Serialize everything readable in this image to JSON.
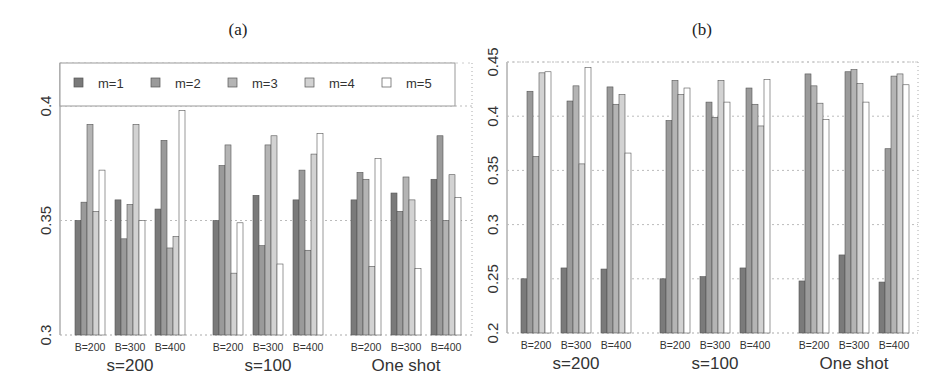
{
  "colors": {
    "m1": "#7a7a7a",
    "m2": "#9a9a9a",
    "m3": "#b4b4b4",
    "m4": "#d2d2d2",
    "m5": "#ffffff",
    "stroke": "#555555",
    "grid": "#bbbbbb"
  },
  "chart_data": [
    {
      "type": "bar",
      "title": "(a)",
      "xlabel": "",
      "ylabel": "",
      "ylim": [
        0.3,
        0.4
      ],
      "yticks": [
        0.3,
        0.35,
        0.4
      ],
      "ytick_labels": [
        "0.3",
        "0.35",
        "0.4"
      ],
      "grid": "horizontal dotted",
      "legend": [
        "m=1",
        "m=2",
        "m=3",
        "m=4",
        "m=5"
      ],
      "legend_position": "top inside",
      "groups": [
        "s=200",
        "s=100",
        "One shot"
      ],
      "subcategories": [
        "B=200",
        "B=300",
        "B=400"
      ],
      "series": [
        {
          "name": "m=1",
          "values": [
            [
              0.35,
              0.359,
              0.355
            ],
            [
              0.35,
              0.361,
              0.359
            ],
            [
              0.359,
              0.362,
              0.368
            ]
          ]
        },
        {
          "name": "m=2",
          "values": [
            [
              0.358,
              0.342,
              0.385
            ],
            [
              0.374,
              0.339,
              0.372
            ],
            [
              0.371,
              0.354,
              0.387
            ]
          ]
        },
        {
          "name": "m=3",
          "values": [
            [
              0.392,
              0.357,
              0.338
            ],
            [
              0.383,
              0.383,
              0.337
            ],
            [
              0.368,
              0.369,
              0.35
            ]
          ]
        },
        {
          "name": "m=4",
          "values": [
            [
              0.354,
              0.392,
              0.343
            ],
            [
              0.327,
              0.387,
              0.379
            ],
            [
              0.33,
              0.359,
              0.37
            ]
          ]
        },
        {
          "name": "m=5",
          "values": [
            [
              0.372,
              0.35,
              0.398
            ],
            [
              0.349,
              0.331,
              0.388
            ],
            [
              0.377,
              0.329,
              0.36
            ]
          ]
        }
      ]
    },
    {
      "type": "bar",
      "title": "(b)",
      "xlabel": "",
      "ylabel": "",
      "ylim": [
        0.2,
        0.45
      ],
      "yticks": [
        0.2,
        0.25,
        0.3,
        0.35,
        0.4,
        0.45
      ],
      "ytick_labels": [
        "0.2",
        "0.25",
        "0.3",
        "0.35",
        "0.4",
        "0.45"
      ],
      "grid": "horizontal dotted",
      "legend": [],
      "groups": [
        "s=200",
        "s=100",
        "One shot"
      ],
      "subcategories": [
        "B=200",
        "B=300",
        "B=400"
      ],
      "series": [
        {
          "name": "m=1",
          "values": [
            [
              0.25,
              0.26,
              0.259
            ],
            [
              0.25,
              0.252,
              0.26
            ],
            [
              0.248,
              0.272,
              0.247
            ]
          ]
        },
        {
          "name": "m=2",
          "values": [
            [
              0.423,
              0.414,
              0.427
            ],
            [
              0.396,
              0.413,
              0.426
            ],
            [
              0.439,
              0.441,
              0.37
            ]
          ]
        },
        {
          "name": "m=3",
          "values": [
            [
              0.363,
              0.428,
              0.411
            ],
            [
              0.433,
              0.399,
              0.411
            ],
            [
              0.428,
              0.443,
              0.437
            ]
          ]
        },
        {
          "name": "m=4",
          "values": [
            [
              0.44,
              0.356,
              0.42
            ],
            [
              0.42,
              0.433,
              0.391
            ],
            [
              0.412,
              0.43,
              0.439
            ]
          ]
        },
        {
          "name": "m=5",
          "values": [
            [
              0.441,
              0.445,
              0.366
            ],
            [
              0.426,
              0.413,
              0.434
            ],
            [
              0.397,
              0.413,
              0.429
            ]
          ]
        }
      ]
    }
  ]
}
